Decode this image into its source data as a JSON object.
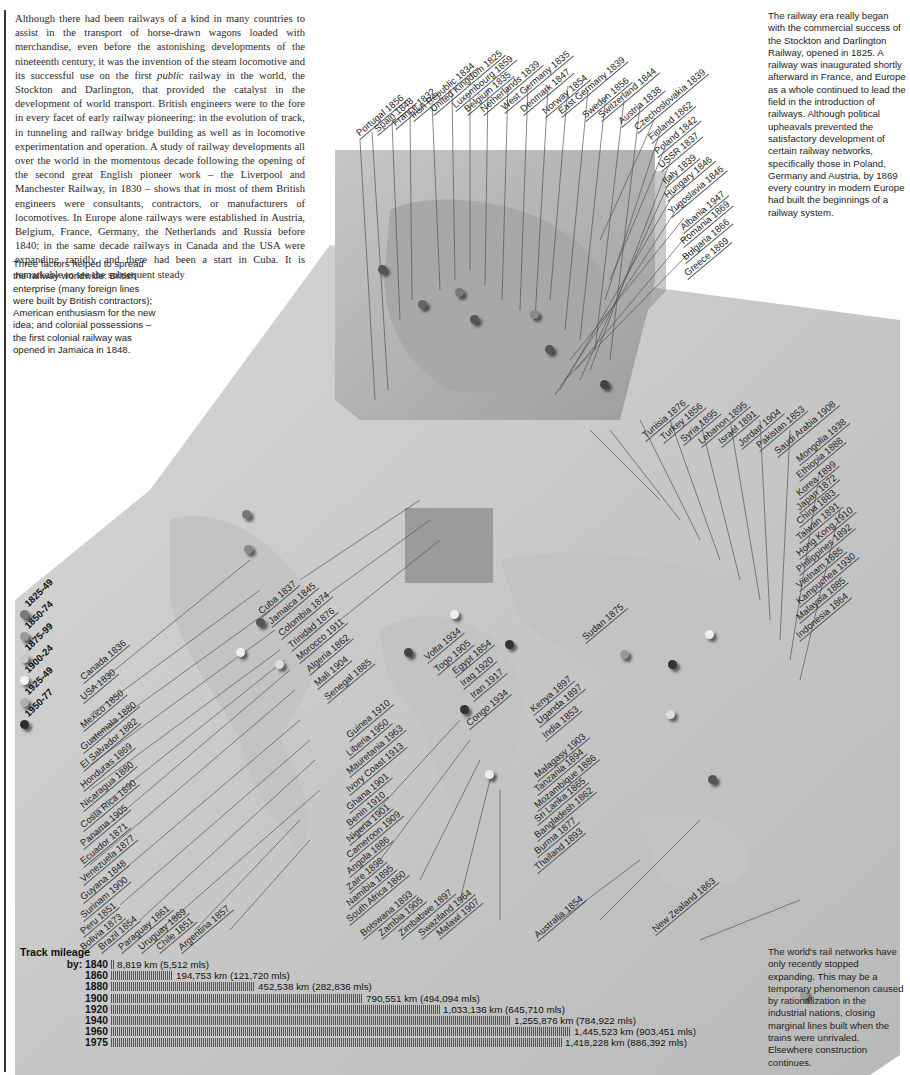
{
  "intro_text": {
    "before_italic": "Although there had been railways of a kind in many countries to assist in the transport of horse-drawn wagons loaded with merchandise, even before the astonishing developments of the nineteenth century, it was the invention of the steam locomotive and its successful use on the first ",
    "italic": "public",
    "after_italic": " railway in the world, the Stockton and Darlington, that provided the catalyst in the development of world transport. British engineers were to the fore in every facet of early railway pioneering: in the evolution of track, in tunneling and railway bridge building as well as in locomotive experimentation and operation. A study of railway developments all over the world in the momentous decade following the opening of the second great English pioneer work – the Liverpool and Manchester Railway, in 1830 – shows that in most of them British engineers were consultants, contractors, or manufacturers of locomotives. In Europe alone railways were established in Austria, Belgium, France, Germany, the Netherlands and Russia before 1840; in the same decade railways in Canada and the USA were expanding rapidly, and there had been a start in Cuba. It is remarkable to see the subsequent steady"
  },
  "sidebar_left": "Three factors helped to spread the railway worldwide: British enterprise (many foreign lines were built by British contractors); American enthusiasm for the new idea; and colonial possessions – the first colonial railway was opened in Jamaica in 1848.",
  "sidebar_right": "The railway era really began with the commercial success of the Stockton and Darlington Railway, opened in 1825. A railway was inaugurated shortly afterward in France, and Europe as a whole continued to lead the field in the introduction of railways. Although political upheavals prevented the satisfactory development of certain railway networks, specifically those in Poland, Germany and Austria, by 1869 every country in modern Europe had built the beginnings of a railway system.",
  "sidebar_bottom": "The world's rail networks have only recently stopped expanding. This may be a temporary phenomenon caused by rationalization in the industrial nations, closing marginal lines built when the trains were unrivaled. Elsewhere construction continues.",
  "legend": {
    "items": [
      {
        "label": "1825-49",
        "color": "#7a7a7a"
      },
      {
        "label": "1850-74",
        "color": "#9a9a9a"
      },
      {
        "label": "1875-99",
        "color": "#c8c8c8"
      },
      {
        "label": "1900-24",
        "color": "#f2f2f2"
      },
      {
        "label": "1925-49",
        "color": "#b0b0b0"
      },
      {
        "label": "1950-77",
        "color": "#2e2e2e"
      }
    ]
  },
  "europe_labels": [
    "Portugal 1856",
    "Spain 1848",
    "France 1832",
    "Irish Republic 1834",
    "United Kingdom 1825",
    "Luxembourg 1859",
    "Belgium 1835",
    "Netherlands 1839",
    "West Germany 1835",
    "Denmark 1847",
    "Norway 1854",
    "East Germany 1839",
    "Sweden 1856",
    "Switzerland 1844",
    "Austria 1838",
    "Czechoslovakia 1839",
    "Finland 1862",
    "Poland 1842",
    "USSR 1837",
    "Italy 1839",
    "Hungary 1846",
    "Yugoslavia 1846",
    "Albania 1947",
    "Romania 1869",
    "Bulgaria 1866",
    "Greece 1869"
  ],
  "americas_labels": [
    "Canada 1836",
    "USA 1830",
    "Mexico 1850",
    "Guatemala 1880",
    "El Salvador 1882",
    "Honduras 1869",
    "Nicaragua 1880",
    "Costa Rica 1890",
    "Panama 1905",
    "Ecuador 1871",
    "Venezuela 1877",
    "Guyana 1848",
    "Surinam 1900",
    "Peru 1851",
    "Bolivia 1873",
    "Brazil 1854",
    "Paraguay 1861",
    "Uruguay 1869",
    "Chile 1851",
    "Argentina 1857"
  ],
  "caribbean_north_africa_labels": [
    "Cuba 1837",
    "Jamaica 1845",
    "Colombia 1874",
    "Trinidad 1876",
    "Morocco 1911",
    "Algeria 1862",
    "Mali 1904",
    "Senegal 1885"
  ],
  "west_africa_labels": [
    "Guinea 1910",
    "Liberia 1950",
    "Mauretania 1963",
    "Ivory Coast 1913",
    "Ghana 1901",
    "Benin 1910",
    "Nigeria 1901",
    "Cameroon 1909",
    "Angola 1886",
    "Zaire 1898",
    "Namibia 1895",
    "South Africa 1860",
    "Botswana 1893",
    "Zambia 1905",
    "Zimbabwe 1897",
    "Swaziland 1964",
    "Malawi 1907"
  ],
  "central_labels": [
    "Volta 1934",
    "Togo 1905",
    "Egypt 1854",
    "Iraq 1920",
    "Iran 1917",
    "Congo 1934",
    "Sudan 1875",
    "Kenya 1897",
    "Uganda 1897",
    "India 1853",
    "Malagasy 1903",
    "Tanzania 1894",
    "Mozambique 1886",
    "Sri Lanka 1865",
    "Bangladesh 1862",
    "Burma 1877",
    "Thailand 1893",
    "Australia 1854",
    "New Zealand 1863"
  ],
  "asia_labels": [
    "Tunisia 1876",
    "Turkey 1856",
    "Syria 1895",
    "Lebanon 1895",
    "Israel 1891",
    "Jordan 1904",
    "Pakistan 1853",
    "Saudi Arabia 1908",
    "Mongolia 1938",
    "Ethiopia 1888",
    "Korea 1899",
    "Japan 1872",
    "China 1883",
    "Taiwan 1891",
    "Hong Kong 1910",
    "Philippines 1892",
    "Vietnam 1885",
    "Kampuchea 1930",
    "Malaysia 1885",
    "Indonesia 1864"
  ],
  "mileage": {
    "title": "Track mileage",
    "prefix": "by:",
    "rows": [
      {
        "year": "1840",
        "value": "8,819 km (5,512 mls)",
        "km": 8819
      },
      {
        "year": "1860",
        "value": "194,753 km (121,720 mls)",
        "km": 194753
      },
      {
        "year": "1880",
        "value": "452,538 km (282,836 mls)",
        "km": 452538
      },
      {
        "year": "1900",
        "value": "790,551 km (494,094 mls)",
        "km": 790551
      },
      {
        "year": "1920",
        "value": "1,033,136 km (645,710 mls)",
        "km": 1033136
      },
      {
        "year": "1940",
        "value": "1,255,876 km (784,922 mls)",
        "km": 1255876
      },
      {
        "year": "1960",
        "value": "1,445,523 km (903,451 mls)",
        "km": 1445523
      },
      {
        "year": "1975",
        "value": "1,418,228 km (886,392 mls)",
        "km": 1418228
      }
    ]
  },
  "chart_data": {
    "type": "bar",
    "title": "Track mileage",
    "categories": [
      "1840",
      "1860",
      "1880",
      "1900",
      "1920",
      "1940",
      "1960",
      "1975"
    ],
    "series": [
      {
        "name": "km",
        "values": [
          8819,
          194753,
          452538,
          790551,
          1033136,
          1255876,
          1445523,
          1418228
        ]
      },
      {
        "name": "mls",
        "values": [
          5512,
          121720,
          282836,
          494094,
          645710,
          784922,
          903451,
          886392
        ]
      }
    ],
    "orientation": "horizontal"
  }
}
